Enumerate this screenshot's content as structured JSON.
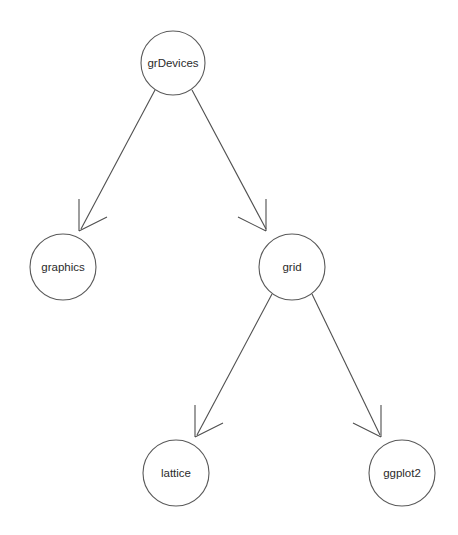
{
  "diagram": {
    "type": "directed-graph",
    "background_color": "#ffffff",
    "node_stroke_color": "#5a5a5a",
    "node_fill_color": "#ffffff",
    "edge_color": "#4f4f4f",
    "label_color": "#2b2b2b",
    "nodes": [
      {
        "id": "grDevices",
        "label": "grDevices",
        "cx": 173,
        "cy": 63,
        "r": 32
      },
      {
        "id": "graphics",
        "label": "graphics",
        "cx": 63,
        "cy": 267,
        "r": 33
      },
      {
        "id": "grid",
        "label": "grid",
        "cx": 292,
        "cy": 267,
        "r": 33
      },
      {
        "id": "lattice",
        "label": "lattice",
        "cx": 176,
        "cy": 473,
        "r": 33
      },
      {
        "id": "ggplot2",
        "label": "ggplot2",
        "cx": 402,
        "cy": 473,
        "r": 33
      }
    ],
    "edges": [
      {
        "from": "grDevices",
        "to": "graphics",
        "x1": 155,
        "y1": 90,
        "x2": 81,
        "y2": 229,
        "direction": "down-left"
      },
      {
        "from": "grDevices",
        "to": "grid",
        "x1": 192,
        "y1": 90,
        "x2": 266,
        "y2": 229,
        "direction": "down-right"
      },
      {
        "from": "grid",
        "to": "lattice",
        "x1": 272,
        "y1": 294,
        "x2": 197,
        "y2": 435,
        "direction": "down-left"
      },
      {
        "from": "grid",
        "to": "ggplot2",
        "x1": 312,
        "y1": 294,
        "x2": 380,
        "y2": 435,
        "direction": "down-right"
      }
    ]
  }
}
